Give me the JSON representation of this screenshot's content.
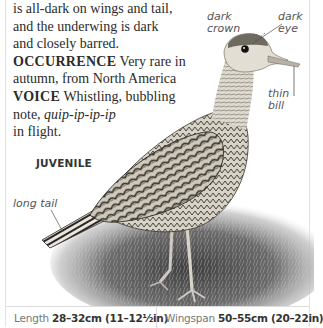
{
  "body_text": {
    "line1": "is all-dark on wings and tail,",
    "line2": "and the underwing is dark",
    "line3": "and closely barred.",
    "occurrence": {
      "keyword": "OCCURRENCE",
      "text_line1": "Very rare in",
      "text_line2": "autumn, from North America"
    },
    "voice": {
      "keyword": "VOICE",
      "text_line1": "Whistling, bubbling",
      "text_line2_prefix": "note, ",
      "call": "quip-ip-ip-ip",
      "text_line3": "in flight."
    }
  },
  "illustration": {
    "subject": "juvenile wading bird (upland sandpiper)",
    "stage_label": "JUVENILE",
    "annotations": {
      "crown": "dark\ncrown",
      "crown_line1": "dark",
      "crown_line2": "crown",
      "eye_line1": "dark",
      "eye_line2": "eye",
      "bill_line1": "thin",
      "bill_line2": "bill",
      "tail": "long tail"
    }
  },
  "measurements": {
    "length": {
      "label": "Length",
      "value": "28–32cm (11–12½in)"
    },
    "wingspan": {
      "label": "Wingspan",
      "value": "50–55cm (20–22in)"
    }
  },
  "colors": {
    "text": "#2b2b2b",
    "label_text": "#555555",
    "rule": "#dcdcdc",
    "plumage_dark": "#3a3630",
    "plumage_light": "#d9d4c8"
  }
}
